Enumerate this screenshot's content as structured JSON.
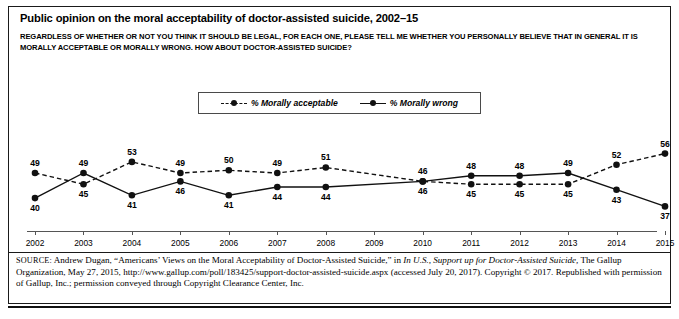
{
  "figure": {
    "title": "Public opinion on the moral acceptability of doctor-assisted suicide, 2002–15",
    "subtitle": "REGARDLESS OF WHETHER OR NOT YOU THINK IT SHOULD BE LEGAL, FOR EACH ONE, PLEASE TELL ME WHETHER YOU PERSONALLY BELIEVE THAT IN GENERAL IT IS MORALLY ACCEPTABLE OR MORALLY WRONG. HOW ABOUT DOCTOR-ASSISTED SUICIDE?",
    "source_prefix": "SOURCE:",
    "source_part1": " Andrew Dugan, “Americans’ Views on the Moral Acceptability of Doctor-Assisted Suicide,” in ",
    "source_italic1": "In U.S., Support up for Doctor-Assisted Suicide,",
    "source_part2": " The Gallup Organization, May 27, 2015, http://www.gallup.com/poll/183425/support-doctor-assisted-suicide.aspx (accessed July 20, 2017). Copyright © 2017. Republished with permission of Gallup, Inc.; permission conveyed through Copyright Clearance Center, Inc."
  },
  "chart_data": {
    "type": "line",
    "title": "Public opinion on the moral acceptability of doctor-assisted suicide, 2002–15",
    "xlabel": "",
    "ylabel": "",
    "categories": [
      "2002",
      "2003",
      "2004",
      "2005",
      "2006",
      "2007",
      "2008",
      "2009",
      "2010",
      "2011",
      "2012",
      "2013",
      "2014",
      "2015"
    ],
    "x": [
      2002,
      2003,
      2004,
      2005,
      2006,
      2007,
      2008,
      2009,
      2010,
      2011,
      2012,
      2013,
      2014,
      2015
    ],
    "ylim": [
      35,
      58
    ],
    "grid": false,
    "legend_position": "top-center",
    "series": [
      {
        "name": "% Morally acceptable",
        "style": "dashed",
        "marker": "circle",
        "color": "#111111",
        "values": [
          49,
          45,
          53,
          49,
          50,
          49,
          51,
          null,
          46,
          45,
          45,
          45,
          52,
          56
        ]
      },
      {
        "name": "% Morally wrong",
        "style": "solid",
        "marker": "circle",
        "color": "#111111",
        "values": [
          40,
          49,
          41,
          46,
          41,
          44,
          44,
          null,
          46,
          48,
          48,
          49,
          43,
          37
        ]
      }
    ],
    "point_labels": {
      "acceptable": [
        "49",
        "45",
        "53",
        "49",
        "50",
        "49",
        "51",
        "",
        "46",
        "45",
        "45",
        "45",
        "52",
        "56"
      ],
      "wrong": [
        "40",
        "49",
        "41",
        "46",
        "41",
        "44",
        "44",
        "",
        "46",
        "48",
        "48",
        "49",
        "43",
        "37"
      ]
    }
  },
  "legend": {
    "items": [
      {
        "label": "% Morally acceptable",
        "style": "dashed"
      },
      {
        "label": "% Morally wrong",
        "style": "solid"
      }
    ]
  }
}
